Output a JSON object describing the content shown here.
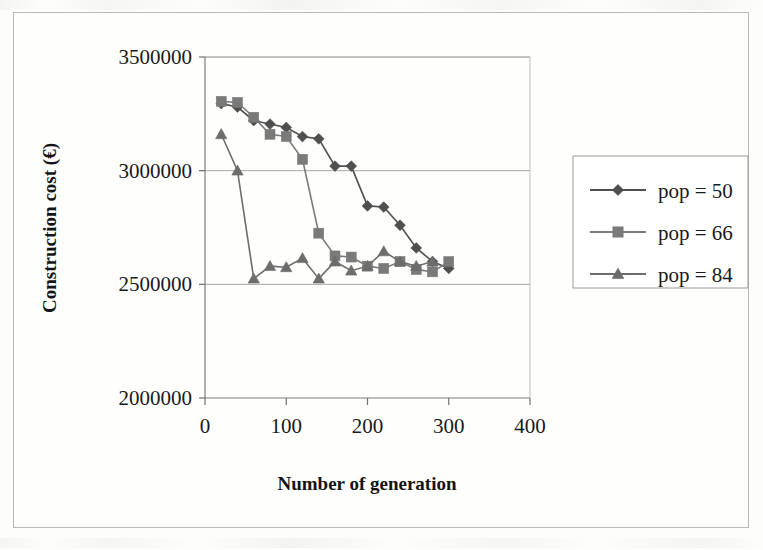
{
  "chart_data": {
    "type": "line",
    "title": "",
    "xlabel": "Number of generation",
    "ylabel": "Construction cost (€)",
    "xlim": [
      0,
      400
    ],
    "ylim": [
      2000000,
      3500000
    ],
    "xticks": [
      0,
      100,
      200,
      300,
      400
    ],
    "xtick_labels": [
      "0",
      "100",
      "200",
      "300",
      "400"
    ],
    "yticks": [
      2000000,
      2500000,
      3000000,
      3500000
    ],
    "ytick_labels": [
      "2000000",
      "2500000",
      "3000000",
      "3500000"
    ],
    "grid": "horizontal",
    "legend_position": "right-outside",
    "series": [
      {
        "name": "pop = 50",
        "marker": "diamond",
        "color": "#4f4f4f",
        "x": [
          20,
          40,
          60,
          80,
          100,
          120,
          140,
          160,
          180,
          200,
          220,
          240,
          260,
          280,
          300
        ],
        "y": [
          3295000,
          3280000,
          3220000,
          3205000,
          3190000,
          3150000,
          3140000,
          3020000,
          3020000,
          2845000,
          2840000,
          2760000,
          2660000,
          2600000,
          2570000
        ]
      },
      {
        "name": "pop = 66",
        "marker": "square",
        "color": "#7a7a7a",
        "x": [
          20,
          40,
          60,
          80,
          100,
          120,
          140,
          160,
          180,
          200,
          220,
          240,
          260,
          280,
          300
        ],
        "y": [
          3305000,
          3300000,
          3235000,
          3160000,
          3150000,
          3050000,
          2725000,
          2625000,
          2620000,
          2580000,
          2570000,
          2600000,
          2565000,
          2555000,
          2600000
        ]
      },
      {
        "name": "pop = 84",
        "marker": "triangle",
        "color": "#6d6d6d",
        "x": [
          20,
          40,
          60,
          80,
          100,
          120,
          140,
          160,
          180,
          200,
          220,
          240,
          260,
          280
        ],
        "y": [
          3160000,
          3000000,
          2525000,
          2580000,
          2575000,
          2615000,
          2525000,
          2600000,
          2560000,
          2580000,
          2645000,
          2600000,
          2580000,
          2600000
        ]
      }
    ]
  },
  "legend": {
    "items": [
      {
        "label": "pop = 50",
        "marker": "diamond"
      },
      {
        "label": "pop = 66",
        "marker": "square"
      },
      {
        "label": "pop = 84",
        "marker": "triangle"
      }
    ]
  },
  "axes": {
    "x_title": "Number of generation",
    "y_title": "Construction cost (€)"
  }
}
